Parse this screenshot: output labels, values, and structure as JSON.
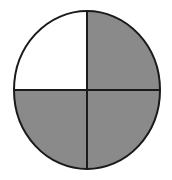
{
  "figure": {
    "name": "fraction-circle",
    "type": "shaded-circle-diagram",
    "shape": "circle",
    "total_parts": 4,
    "shaded_parts": 3,
    "unshaded_parts": 1,
    "fraction_shaded": "3/4",
    "divisions": [
      "vertical-diameter",
      "horizontal-diameter"
    ],
    "background_color": "#ffffff"
  },
  "geometry": {
    "canvas_width": 172,
    "canvas_height": 180,
    "center_x": 87,
    "center_y": 90,
    "radius_x": 73,
    "radius_y": 79,
    "outline_width": 2,
    "divider_width": 2
  },
  "colors": {
    "shaded_fill": "#8a8a8a",
    "unshaded_fill": "#ffffff",
    "outline_stroke": "#1a1a1a",
    "divider_stroke": "#1a1a1a",
    "background": "#ffffff"
  },
  "quadrants": [
    {
      "id": "top-left",
      "position": "top-left",
      "shaded": false,
      "fill": "#ffffff",
      "path": "M 87 90 L 87 11 A 73 79 0 0 0 14 90 Z"
    },
    {
      "id": "top-right",
      "position": "top-right",
      "shaded": true,
      "fill": "#8a8a8a",
      "path": "M 87 90 L 87 11 A 73 79 0 0 1 160 90 Z"
    },
    {
      "id": "bottom-right",
      "position": "bottom-right",
      "shaded": true,
      "fill": "#8a8a8a",
      "path": "M 87 90 L 160 90 A 73 79 0 0 1 87 169 Z"
    },
    {
      "id": "bottom-left",
      "position": "bottom-left",
      "shaded": true,
      "fill": "#8a8a8a",
      "path": "M 87 90 L 87 169 A 73 79 0 0 1 14 90 Z"
    }
  ],
  "dividers": [
    {
      "id": "vertical-diameter",
      "x1": 87,
      "y1": 11,
      "x2": 87,
      "y2": 169
    },
    {
      "id": "horizontal-diameter",
      "x1": 14,
      "y1": 90,
      "x2": 160,
      "y2": 90
    }
  ],
  "labels": {
    "title": "",
    "caption": "",
    "annotations": []
  }
}
